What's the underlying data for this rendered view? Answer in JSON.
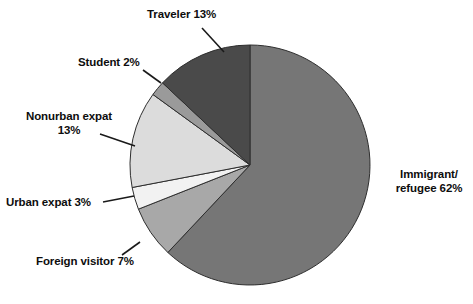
{
  "chart_data": {
    "type": "pie",
    "title": "",
    "subtitle": "",
    "xlabel": "",
    "ylabel": "",
    "legend_position": "none",
    "grid": false,
    "units": "percent",
    "total": 100,
    "start_angle_deg": 0,
    "direction": "clockwise",
    "categories": [
      "Immigrant/refugee",
      "Foreign visitor",
      "Urban expat",
      "Nonurban expat",
      "Student",
      "Traveler"
    ],
    "values": [
      62,
      7,
      3,
      13,
      2,
      13
    ],
    "colors": [
      "#767676",
      "#a8a8a8",
      "#f2f2f2",
      "#dcdcdc",
      "#9a9a9a",
      "#4a4a4a"
    ],
    "slices": [
      {
        "name": "Immigrant/refugee",
        "value": 62,
        "color": "#767676",
        "label_line1": "Immigrant/",
        "label_line2": "refugee 62%",
        "label_text": "Immigrant/\nrefugee 62%"
      },
      {
        "name": "Foreign visitor",
        "value": 7,
        "color": "#a8a8a8",
        "label_line1": "Foreign visitor 7%",
        "label_line2": "",
        "label_text": "Foreign visitor 7%"
      },
      {
        "name": "Urban expat",
        "value": 3,
        "color": "#f2f2f2",
        "label_line1": "Urban expat 3%",
        "label_line2": "",
        "label_text": "Urban expat 3%"
      },
      {
        "name": "Nonurban expat",
        "value": 13,
        "color": "#dcdcdc",
        "label_line1": "Nonurban expat",
        "label_line2": "13%",
        "label_text": "Nonurban expat\n13%"
      },
      {
        "name": "Student",
        "value": 2,
        "color": "#9a9a9a",
        "label_line1": "Student 2%",
        "label_line2": "",
        "label_text": "Student 2%"
      },
      {
        "name": "Traveler",
        "value": 13,
        "color": "#4a4a4a",
        "label_line1": "Traveler 13%",
        "label_line2": "",
        "label_text": "Traveler 13%"
      }
    ]
  },
  "geometry": {
    "center_x": 250,
    "center_y": 165,
    "radius": 120
  },
  "style": {
    "background": "#ffffff",
    "outline": "#2e2e2e",
    "text_color": "#0d0d0d",
    "leader_color": "#1a1a1a"
  }
}
